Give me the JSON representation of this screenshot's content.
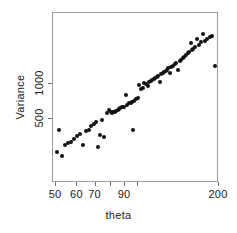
{
  "chart_data": {
    "type": "scatter",
    "title": "",
    "xlabel": "theta",
    "ylabel": "Variance",
    "xscale": "log",
    "yscale": "log",
    "xlim": [
      47,
      205
    ],
    "ylim": [
      230,
      3000
    ],
    "grid": false,
    "legend": null,
    "xtick_labels": [
      "50",
      "60",
      "70",
      "90",
      "200"
    ],
    "xtick_values": [
      50,
      60,
      70,
      90,
      200
    ],
    "xtick_values_all": [
      50,
      60,
      70,
      80,
      90,
      100,
      200
    ],
    "ytick_labels": [
      "500",
      "1000"
    ],
    "ytick_values": [
      500,
      1000
    ],
    "marker": "filled-circle",
    "marker_color": "#111111",
    "frame_color": "#9a9a9a",
    "background": "#ffffff",
    "n_points": 86,
    "points": [
      [
        50.5,
        258
      ],
      [
        52.5,
        240
      ],
      [
        51.5,
        400
      ],
      [
        54.0,
        300
      ],
      [
        55.5,
        310
      ],
      [
        57.0,
        320
      ],
      [
        58.5,
        335
      ],
      [
        60.0,
        355
      ],
      [
        61.5,
        372
      ],
      [
        63.0,
        300
      ],
      [
        64.5,
        395
      ],
      [
        66.0,
        405
      ],
      [
        67.5,
        432
      ],
      [
        69.0,
        455
      ],
      [
        70.5,
        470
      ],
      [
        71.5,
        285
      ],
      [
        72.5,
        362
      ],
      [
        74.0,
        490
      ],
      [
        75.5,
        352
      ],
      [
        77.0,
        560
      ],
      [
        78.5,
        600
      ],
      [
        79.5,
        575
      ],
      [
        80.5,
        565
      ],
      [
        81.5,
        572
      ],
      [
        82.5,
        580
      ],
      [
        83.5,
        590
      ],
      [
        84.5,
        600
      ],
      [
        85.5,
        610
      ],
      [
        86.5,
        620
      ],
      [
        88.0,
        630
      ],
      [
        89.5,
        640
      ],
      [
        90.5,
        800
      ],
      [
        91.5,
        660
      ],
      [
        93.0,
        680
      ],
      [
        94.5,
        690
      ],
      [
        95.5,
        700
      ],
      [
        96.0,
        400
      ],
      [
        97.0,
        720
      ],
      [
        98.5,
        740
      ],
      [
        100.0,
        760
      ],
      [
        101.5,
        980
      ],
      [
        103.0,
        900
      ],
      [
        104.5,
        930
      ],
      [
        106.0,
        1020
      ],
      [
        107.5,
        1000
      ],
      [
        109.0,
        960
      ],
      [
        110.5,
        1040
      ],
      [
        112.0,
        1060
      ],
      [
        113.5,
        1090
      ],
      [
        115.0,
        1110
      ],
      [
        116.5,
        1130
      ],
      [
        118.0,
        1160
      ],
      [
        119.5,
        1180
      ],
      [
        121.0,
        1050
      ],
      [
        122.5,
        1210
      ],
      [
        124.0,
        1240
      ],
      [
        125.5,
        1270
      ],
      [
        127.0,
        1300
      ],
      [
        128.5,
        1330
      ],
      [
        130.0,
        1360
      ],
      [
        131.5,
        1240
      ],
      [
        133.0,
        1400
      ],
      [
        135.0,
        1440
      ],
      [
        137.0,
        1480
      ],
      [
        139.0,
        1520
      ],
      [
        141.0,
        1330
      ],
      [
        143.0,
        1570
      ],
      [
        145.0,
        1620
      ],
      [
        147.0,
        1670
      ],
      [
        149.0,
        1720
      ],
      [
        151.0,
        1780
      ],
      [
        153.0,
        1830
      ],
      [
        155.0,
        1890
      ],
      [
        157.0,
        2240
      ],
      [
        159.0,
        1950
      ],
      [
        161.0,
        2010
      ],
      [
        163.0,
        2080
      ],
      [
        166.0,
        2420
      ],
      [
        169.0,
        2160
      ],
      [
        172.0,
        2280
      ],
      [
        175.0,
        2700
      ],
      [
        178.0,
        2350
      ],
      [
        181.0,
        2440
      ],
      [
        185.0,
        2520
      ],
      [
        189.0,
        2600
      ],
      [
        193.0,
        1420
      ]
    ]
  }
}
